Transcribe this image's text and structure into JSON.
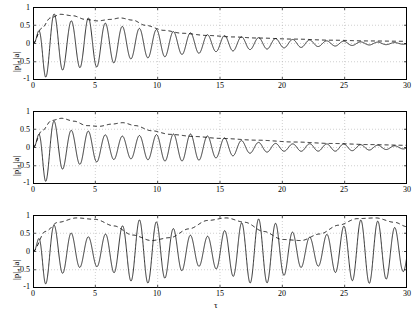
{
  "figure": {
    "background": "#ffffff",
    "line_color": "#000000",
    "grid_color": "#b0b0b0"
  },
  "chart_data": {
    "type": "line",
    "title": "",
    "xlabel": "τ",
    "ylabel": "|p|, |a|",
    "xlim": [
      0,
      30
    ],
    "ylim": [
      -1,
      1
    ],
    "xticks": [
      0,
      5,
      10,
      15,
      20,
      25,
      30
    ],
    "yticks": [
      -1,
      -0.5,
      0,
      0.5,
      1
    ],
    "xtick_labels": [
      "0",
      "5",
      "10",
      "15",
      "20",
      "25",
      "30"
    ],
    "ytick_labels": [
      "-1",
      "-0.5",
      "0",
      "0.5",
      "1"
    ],
    "grid": true,
    "legend": null,
    "panels": [
      {
        "label": "(a)",
        "series": [
          {
            "name": "|p|",
            "style": "solid",
            "description": "fast oscillatory envelope-modulated signal decaying toward zero by tau=30",
            "envelope_points": [
              {
                "x": 0.0,
                "y": 0.0
              },
              {
                "x": 1.0,
                "y": 0.92
              },
              {
                "x": 2.0,
                "y": 0.78
              },
              {
                "x": 3.0,
                "y": 0.62
              },
              {
                "x": 4.5,
                "y": 0.7
              },
              {
                "x": 6.0,
                "y": 0.55
              },
              {
                "x": 8.0,
                "y": 0.42
              },
              {
                "x": 10.0,
                "y": 0.38
              },
              {
                "x": 12.0,
                "y": 0.3
              },
              {
                "x": 15.0,
                "y": 0.22
              },
              {
                "x": 18.0,
                "y": 0.16
              },
              {
                "x": 21.0,
                "y": 0.11
              },
              {
                "x": 24.0,
                "y": 0.07
              },
              {
                "x": 27.0,
                "y": 0.04
              },
              {
                "x": 30.0,
                "y": 0.02
              }
            ],
            "frequency": 4.6
          },
          {
            "name": "|a|",
            "style": "dashed",
            "description": "slow smooth envelope rising to a broad maximum near tau=7 then decaying",
            "points": [
              {
                "x": 0.0,
                "y": 0.0
              },
              {
                "x": 0.7,
                "y": 0.42
              },
              {
                "x": 1.4,
                "y": 0.7
              },
              {
                "x": 2.2,
                "y": 0.8
              },
              {
                "x": 3.2,
                "y": 0.76
              },
              {
                "x": 4.2,
                "y": 0.66
              },
              {
                "x": 5.2,
                "y": 0.62
              },
              {
                "x": 6.2,
                "y": 0.66
              },
              {
                "x": 7.0,
                "y": 0.7
              },
              {
                "x": 8.0,
                "y": 0.64
              },
              {
                "x": 9.0,
                "y": 0.5
              },
              {
                "x": 10.5,
                "y": 0.36
              },
              {
                "x": 12.0,
                "y": 0.28
              },
              {
                "x": 14.0,
                "y": 0.22
              },
              {
                "x": 16.0,
                "y": 0.18
              },
              {
                "x": 18.0,
                "y": 0.15
              },
              {
                "x": 21.0,
                "y": 0.12
              },
              {
                "x": 24.0,
                "y": 0.09
              },
              {
                "x": 27.0,
                "y": 0.07
              },
              {
                "x": 30.0,
                "y": 0.06
              }
            ]
          }
        ]
      },
      {
        "label": "(b)",
        "series": [
          {
            "name": "|p|",
            "style": "solid",
            "description": "fast oscillatory signal, slower decay than (a), small residual oscillation at tau=30",
            "envelope_points": [
              {
                "x": 0.0,
                "y": 0.0
              },
              {
                "x": 1.0,
                "y": 0.95
              },
              {
                "x": 2.0,
                "y": 0.72
              },
              {
                "x": 3.0,
                "y": 0.58
              },
              {
                "x": 4.5,
                "y": 0.66
              },
              {
                "x": 6.0,
                "y": 0.58
              },
              {
                "x": 8.0,
                "y": 0.5
              },
              {
                "x": 10.0,
                "y": 0.44
              },
              {
                "x": 12.0,
                "y": 0.38
              },
              {
                "x": 15.0,
                "y": 0.3
              },
              {
                "x": 18.0,
                "y": 0.22
              },
              {
                "x": 21.0,
                "y": 0.16
              },
              {
                "x": 24.0,
                "y": 0.11
              },
              {
                "x": 27.0,
                "y": 0.07
              },
              {
                "x": 30.0,
                "y": 0.05
              }
            ],
            "frequency": 4.6
          },
          {
            "name": "|a|",
            "style": "dashed",
            "description": "slow envelope with maxima near tau=2 and tau=7, then slow decay",
            "points": [
              {
                "x": 0.0,
                "y": 0.0
              },
              {
                "x": 0.7,
                "y": 0.45
              },
              {
                "x": 1.5,
                "y": 0.74
              },
              {
                "x": 2.3,
                "y": 0.8
              },
              {
                "x": 3.3,
                "y": 0.72
              },
              {
                "x": 4.3,
                "y": 0.6
              },
              {
                "x": 5.3,
                "y": 0.58
              },
              {
                "x": 6.3,
                "y": 0.64
              },
              {
                "x": 7.2,
                "y": 0.68
              },
              {
                "x": 8.2,
                "y": 0.6
              },
              {
                "x": 9.5,
                "y": 0.46
              },
              {
                "x": 11.0,
                "y": 0.36
              },
              {
                "x": 13.0,
                "y": 0.3
              },
              {
                "x": 15.0,
                "y": 0.25
              },
              {
                "x": 18.0,
                "y": 0.2
              },
              {
                "x": 21.0,
                "y": 0.15
              },
              {
                "x": 24.0,
                "y": 0.11
              },
              {
                "x": 27.0,
                "y": 0.08
              },
              {
                "x": 30.0,
                "y": 0.06
              }
            ]
          }
        ]
      },
      {
        "label": "(c)",
        "series": [
          {
            "name": "|p|",
            "style": "solid",
            "description": "sustained fast oscillation with nearly constant large amplitude over the whole range",
            "envelope_points": [
              {
                "x": 0.0,
                "y": 0.0
              },
              {
                "x": 1.0,
                "y": 0.95
              },
              {
                "x": 2.0,
                "y": 0.85
              },
              {
                "x": 4.0,
                "y": 0.9
              },
              {
                "x": 6.0,
                "y": 0.85
              },
              {
                "x": 8.0,
                "y": 0.88
              },
              {
                "x": 10.0,
                "y": 0.86
              },
              {
                "x": 13.0,
                "y": 0.9
              },
              {
                "x": 16.0,
                "y": 0.86
              },
              {
                "x": 19.0,
                "y": 0.9
              },
              {
                "x": 22.0,
                "y": 0.86
              },
              {
                "x": 25.0,
                "y": 0.9
              },
              {
                "x": 28.0,
                "y": 0.86
              },
              {
                "x": 30.0,
                "y": 0.88
              }
            ],
            "frequency": 4.6
          },
          {
            "name": "|a|",
            "style": "dashed",
            "description": "slow quasi-periodic envelope oscillating between about 0.25 and 0.95 with period near 9",
            "points": [
              {
                "x": 0.0,
                "y": 0.0
              },
              {
                "x": 1.0,
                "y": 0.55
              },
              {
                "x": 2.0,
                "y": 0.8
              },
              {
                "x": 3.5,
                "y": 0.92
              },
              {
                "x": 5.0,
                "y": 0.88
              },
              {
                "x": 6.5,
                "y": 0.7
              },
              {
                "x": 8.0,
                "y": 0.45
              },
              {
                "x": 9.5,
                "y": 0.3
              },
              {
                "x": 11.0,
                "y": 0.38
              },
              {
                "x": 12.5,
                "y": 0.62
              },
              {
                "x": 14.0,
                "y": 0.85
              },
              {
                "x": 15.5,
                "y": 0.92
              },
              {
                "x": 17.0,
                "y": 0.8
              },
              {
                "x": 18.5,
                "y": 0.55
              },
              {
                "x": 20.0,
                "y": 0.33
              },
              {
                "x": 21.5,
                "y": 0.3
              },
              {
                "x": 23.0,
                "y": 0.48
              },
              {
                "x": 24.5,
                "y": 0.72
              },
              {
                "x": 26.0,
                "y": 0.9
              },
              {
                "x": 27.5,
                "y": 0.92
              },
              {
                "x": 29.0,
                "y": 0.8
              },
              {
                "x": 30.0,
                "y": 0.68
              }
            ]
          }
        ]
      }
    ]
  }
}
